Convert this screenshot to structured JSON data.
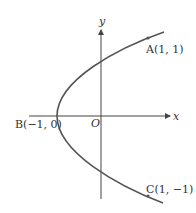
{
  "diagram": {
    "type": "parabola",
    "equation_hint": "x = 2y^2 - 1",
    "axes": {
      "x_label": "x",
      "y_label": "y",
      "origin_label": "O"
    },
    "points": [
      {
        "name": "A",
        "label": "A(1, 1)",
        "x": 1,
        "y": 1
      },
      {
        "name": "B",
        "label": "B(−1, 0)",
        "x": -1,
        "y": 0
      },
      {
        "name": "C",
        "label": "C(1, −1)",
        "x": 1,
        "y": -1
      }
    ],
    "colors": {
      "curve": "#555555",
      "axis": "#444444",
      "text": "#333333"
    }
  }
}
